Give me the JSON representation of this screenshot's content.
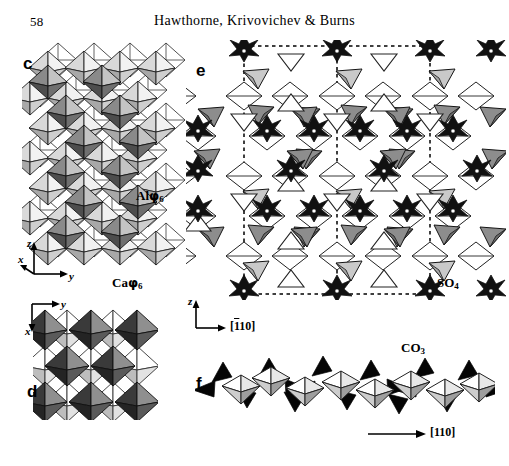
{
  "page": {
    "folio": "58",
    "running_head": "Hawthorne, Krivovichev & Burns",
    "width": 509,
    "height": 466,
    "background": "#ffffff"
  },
  "palette": {
    "outline": "#1a1a1a",
    "white_face": "#ffffff",
    "light_gray_face": "#d2d2d2",
    "mid_gray_face": "#9a9a9a",
    "dark_gray_face": "#6e6e6e",
    "near_black_face": "#2b2b2b",
    "black_face": "#000000",
    "dashed_cell": "#000000"
  },
  "panels": [
    {
      "id": "c",
      "letter": "c",
      "caption_labels": [
        "Alφ6",
        "Caφ6"
      ],
      "axes": [
        "z",
        "y",
        "x"
      ],
      "description": "Sheet of corner-sharing Alφ6 and Caφ6 octahedra viewed along x"
    },
    {
      "id": "d",
      "letter": "d",
      "caption_labels": [],
      "axes": [
        "y",
        "x"
      ],
      "description": "Octahedral sheet projected down z"
    },
    {
      "id": "e",
      "letter": "e",
      "caption_labels": [
        "SO4"
      ],
      "axes": [
        "z"
      ],
      "direction": "[̄1 1 0]",
      "description": "Framework of octahedra and SO4 tetrahedra with dashed unit cell"
    },
    {
      "id": "f",
      "letter": "f",
      "caption_labels": [
        "CO3"
      ],
      "direction": "[110]",
      "description": "Chain of octahedra decorated by CO3 triangles"
    }
  ],
  "labels": {
    "panel_c_letter": "c",
    "panel_d_letter": "d",
    "panel_e_letter": "e",
    "panel_f_letter": "f",
    "al_phi6_element": "Al",
    "al_phi6_phi": "φ",
    "al_phi6_sub": "6",
    "ca_phi6_element": "Ca",
    "ca_phi6_phi": "φ",
    "ca_phi6_sub": "6",
    "so4_element": "SO",
    "so4_sub": "4",
    "co3_element": "CO",
    "co3_sub": "3",
    "axis_z": "z",
    "axis_y": "y",
    "axis_x": "x",
    "axis_z_e": "z",
    "dir_bar110_open": "[",
    "dir_bar110_bar": "1",
    "dir_bar110_rest": "10]",
    "dir_110": "[110]"
  }
}
